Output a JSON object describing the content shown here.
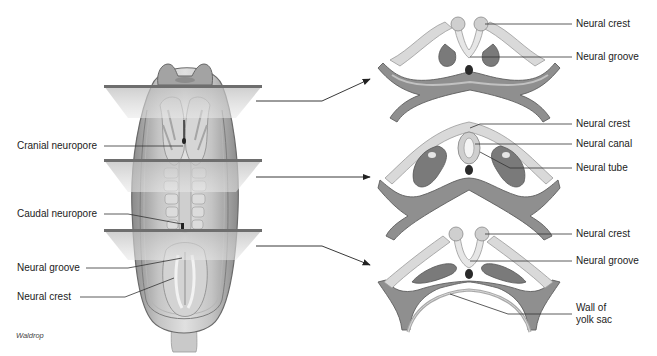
{
  "figure": {
    "credit": "Waldrop",
    "colors": {
      "background": "#ffffff",
      "text": "#222222",
      "leader_line": "#333333",
      "plane_fill": "#d8d8d8",
      "plane_edge": "#6e6e6e",
      "tissue_dark": "#7a7a7a",
      "tissue_mid": "#a9a9a9",
      "tissue_light": "#d9d9d9",
      "notochord": "#2a2a2a"
    },
    "embryo": {
      "labels": {
        "cranial_neuropore": "Cranial neuropore",
        "caudal_neuropore": "Caudal neuropore",
        "neural_groove": "Neural groove",
        "neural_crest": "Neural crest"
      },
      "section_planes": 3
    },
    "sections": [
      {
        "id": "top",
        "labels": {
          "neural_crest": "Neural crest",
          "neural_groove": "Neural groove"
        }
      },
      {
        "id": "middle",
        "labels": {
          "neural_crest": "Neural crest",
          "neural_canal": "Neural canal",
          "neural_tube": "Neural tube"
        }
      },
      {
        "id": "bottom",
        "labels": {
          "neural_crest": "Neural crest",
          "neural_groove": "Neural groove",
          "wall_of_yolk_sac_line1": "Wall of",
          "wall_of_yolk_sac_line2": "yolk sac"
        }
      }
    ]
  }
}
